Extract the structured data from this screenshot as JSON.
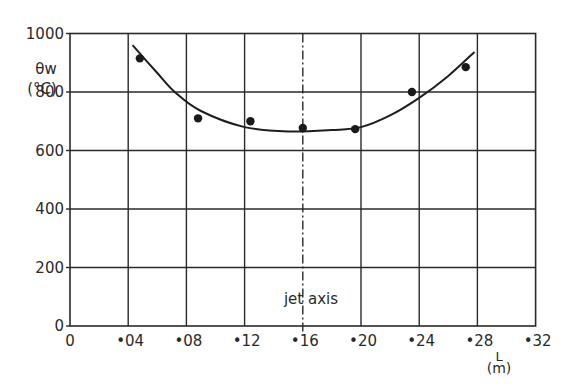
{
  "chart_data": {
    "type": "scatter",
    "title": "",
    "xlabel": "L (m)",
    "ylabel": "θw (°C)",
    "xlim": [
      0,
      0.32
    ],
    "ylim": [
      0,
      1000
    ],
    "grid": true,
    "x_ticks": [
      0,
      0.04,
      0.08,
      0.12,
      0.16,
      0.2,
      0.24,
      0.28,
      0.32
    ],
    "x_tick_labels": [
      "0",
      "•04",
      "•08",
      "•12",
      "•16",
      "•20",
      "•24",
      "•28",
      "•32"
    ],
    "y_ticks": [
      0,
      200,
      400,
      600,
      800,
      1000
    ],
    "y_tick_labels": [
      "0",
      "200",
      "400",
      "600",
      "800",
      "1000"
    ],
    "series": [
      {
        "name": "measured",
        "style": "points",
        "x": [
          0.048,
          0.088,
          0.124,
          0.16,
          0.196,
          0.235,
          0.272
        ],
        "y": [
          915,
          710,
          700,
          677,
          673,
          800,
          885
        ]
      },
      {
        "name": "fitted curve",
        "style": "line",
        "x": [
          0.043,
          0.06,
          0.072,
          0.09,
          0.12,
          0.15,
          0.18,
          0.2,
          0.22,
          0.24,
          0.26,
          0.278
        ],
        "y": [
          960,
          865,
          800,
          735,
          680,
          665,
          670,
          680,
          720,
          780,
          855,
          937
        ]
      }
    ],
    "annotations": [
      {
        "text": "jet axis",
        "x": 0.16,
        "type": "vertical dash-dot line"
      }
    ]
  },
  "labels": {
    "y_symbol": "θw",
    "y_unit": "(°C)",
    "x_symbol": "L",
    "x_unit": "(m)",
    "jet_axis": "jet axis"
  }
}
